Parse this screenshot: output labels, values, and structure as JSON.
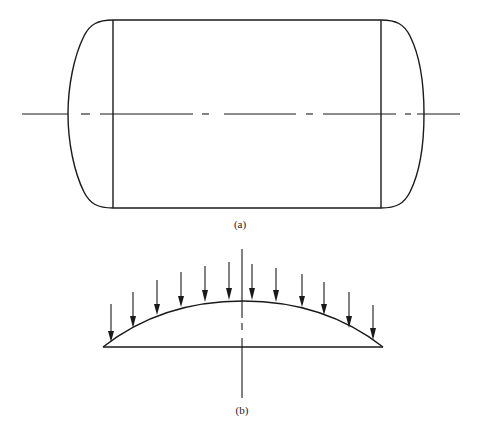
{
  "figure": {
    "panels": [
      {
        "id": "a",
        "label": "(a)",
        "description": "Cylindrical pressure vessel with two dished (torispherical) heads, side elevation with dash-dot horizontal centerline",
        "elements": {
          "shell": "cylinder",
          "heads": [
            "left-dished-head",
            "right-dished-head"
          ],
          "centerline": "horizontal dash-dot"
        }
      },
      {
        "id": "b",
        "label": "(b)",
        "description": "Dished head under uniform external pressure, shown as arc with downward load arrows and vertical axis",
        "elements": {
          "load_arrows_count": 12,
          "arc": "spherical cap",
          "axis": "vertical dash"
        }
      }
    ],
    "colors": {
      "ink": "#1a1a1a",
      "background": "#ffffff"
    }
  }
}
